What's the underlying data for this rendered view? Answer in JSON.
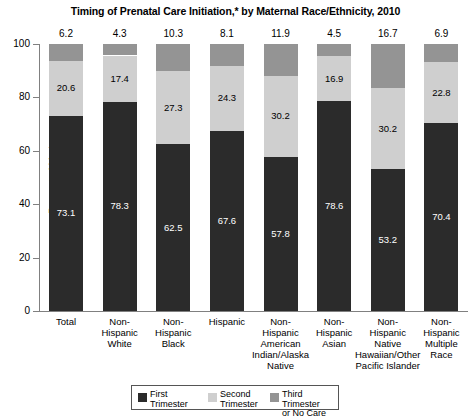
{
  "chart_data": {
    "type": "bar",
    "subtype": "stacked-bar-100",
    "title": "Timing of Prenatal Care Initiation,* by Maternal Race/Ethnicity, 2010",
    "xlabel": "",
    "ylabel": "Percent of Mothers",
    "ylim": [
      0,
      100
    ],
    "yticks": [
      0,
      20,
      40,
      60,
      80,
      100
    ],
    "grid": false,
    "legend_position": "bottom",
    "categories": [
      "Total",
      "Non-Hispanic White",
      "Non-Hispanic Black",
      "Hispanic",
      "Non-Hispanic American Indian/Alaska Native",
      "Non-Hispanic Asian",
      "Non-Hispanic Native Hawaiian/Other Pacific Islander",
      "Non-Hispanic Multiple Race"
    ],
    "category_label_lines": [
      [
        "Total"
      ],
      [
        "Non-",
        "Hispanic",
        "White"
      ],
      [
        "Non-",
        "Hispanic",
        "Black"
      ],
      [
        "Hispanic"
      ],
      [
        "Non-",
        "Hispanic",
        "American",
        "Indian/Alaska",
        "Native"
      ],
      [
        "Non-",
        "Hispanic",
        "Asian"
      ],
      [
        "Non-",
        "Hispanic",
        "Native",
        "Hawaiian/Other",
        "Pacific Islander"
      ],
      [
        "Non-",
        "Hispanic",
        "Multiple",
        "Race"
      ]
    ],
    "series": [
      {
        "name": "First Trimester",
        "color": "#2b2b2b",
        "values": [
          73.1,
          78.3,
          62.5,
          67.6,
          57.8,
          78.6,
          53.2,
          70.4
        ]
      },
      {
        "name": "Second Trimester",
        "color": "#cfcfcf",
        "values": [
          20.6,
          17.4,
          27.3,
          24.3,
          30.2,
          16.9,
          30.2,
          22.8
        ]
      },
      {
        "name": "Third Trimester or No Care",
        "color": "#949494",
        "values": [
          6.2,
          4.3,
          10.3,
          8.1,
          11.9,
          4.5,
          16.7,
          6.9
        ]
      }
    ],
    "top_values": [
      "6.2",
      "4.3",
      "10.3",
      "8.1",
      "11.9",
      "4.5",
      "16.7",
      "6.9"
    ],
    "first_trimester_labels": [
      "73.1",
      "78.3",
      "62.5",
      "67.6",
      "57.8",
      "78.6",
      "53.2",
      "70.4"
    ],
    "second_trimester_labels": [
      "20.6",
      "17.4",
      "27.3",
      "24.3",
      "30.2",
      "16.9",
      "30.2",
      "22.8"
    ]
  },
  "legend": {
    "items": [
      {
        "label": "First\nTrimester",
        "color": "#2b2b2b",
        "name": "first-trimester"
      },
      {
        "label": "Second\nTrimester",
        "color": "#cfcfcf",
        "name": "second-trimester"
      },
      {
        "label": "Third Trimester\nor No Care",
        "color": "#949494",
        "name": "third-trimester-or-no-care"
      }
    ]
  }
}
